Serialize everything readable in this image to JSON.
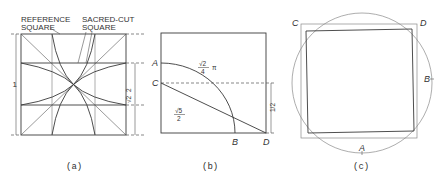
{
  "panels": {
    "a": {
      "caption": "(a)",
      "label_reference": [
        "REFERENCE",
        "SQUARE"
      ],
      "label_sacred": [
        "SACRED-CUT",
        "SQUARE"
      ],
      "dim_left": "1",
      "dim_right_num": "√2",
      "dim_right_den": "2"
    },
    "b": {
      "caption": "(b)",
      "point_A": "A",
      "point_B": "B",
      "point_C": "C",
      "point_D": "D",
      "arc_label_num": "√2",
      "arc_label_den": "4",
      "arc_label_suffix": "π",
      "diag_label_num": "√5",
      "diag_label_den": "2",
      "dim_right": "1/2"
    },
    "c": {
      "caption": "(c)",
      "point_A": "A",
      "point_B": "B",
      "point_C": "C",
      "point_D": "D"
    }
  }
}
